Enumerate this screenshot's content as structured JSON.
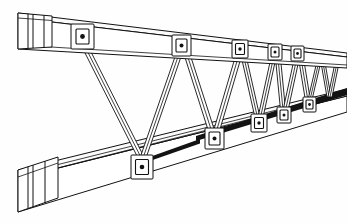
{
  "drawing": {
    "title": "Open-web truss joist perspective line drawing",
    "subject": "truss-joist",
    "view": "perspective",
    "background_color": "#fefefe",
    "line_color": "#111111",
    "shade_color": "#131313",
    "canvas": {
      "width": 347,
      "height": 223
    }
  },
  "components": {
    "top_chord": {
      "label": "top chord",
      "type": "box-beam",
      "end_cap_divider_count": 3,
      "left_x": 18,
      "right_x": 347
    },
    "bottom_chord": {
      "label": "bottom chord",
      "type": "box-beam",
      "end_cap_divider_count": 3,
      "left_x": 18,
      "right_x": 347,
      "has_dark_top_face_shading": true
    },
    "web_members": {
      "label": "diagonal web members",
      "type": "tube",
      "pattern": "warren-zigzag",
      "count": 12
    },
    "connector_plates": {
      "label": "bolted connector plate",
      "bolt_label": "bolt head",
      "top_chord_count": 5,
      "bottom_chord_count": 5
    }
  },
  "geometry": {
    "top_chord_front_top": [
      [
        18,
        18
      ],
      [
        347,
        57
      ]
    ],
    "top_chord_front_bottom": [
      [
        18,
        49
      ],
      [
        347,
        68
      ]
    ],
    "top_chord_back_top": [
      [
        18,
        13
      ],
      [
        347,
        53
      ]
    ],
    "bottom_chord_front_top": [
      [
        18,
        178
      ],
      [
        347,
        96
      ]
    ],
    "bottom_chord_front_bottom": [
      [
        18,
        212
      ],
      [
        347,
        112
      ]
    ],
    "bottom_chord_back_top": [
      [
        18,
        170
      ],
      [
        347,
        92
      ]
    ],
    "panel_points_top": [
      {
        "index": 0,
        "x": 84,
        "y": 33
      },
      {
        "index": 1,
        "x": 182,
        "y": 43
      },
      {
        "index": 2,
        "x": 240,
        "y": 47
      },
      {
        "index": 3,
        "x": 275,
        "y": 50
      },
      {
        "index": 4,
        "x": 298,
        "y": 52
      }
    ],
    "panel_points_bottom": [
      {
        "index": 0,
        "x": 142,
        "y": 161
      },
      {
        "index": 1,
        "x": 214,
        "y": 137
      },
      {
        "index": 2,
        "x": 259,
        "y": 123
      },
      {
        "index": 3,
        "x": 283,
        "y": 116
      },
      {
        "index": 4,
        "x": 309,
        "y": 105
      }
    ]
  }
}
